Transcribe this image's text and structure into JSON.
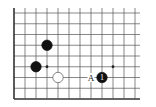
{
  "diagram": {
    "type": "go-board-fragment",
    "grid": {
      "cols": 12,
      "rows": 9,
      "origin_x": 14,
      "origin_y": 13,
      "spacing_x": 11,
      "spacing_y": 10.75,
      "line_color": "#555555",
      "edge_color": "#333333",
      "edges": [
        "left",
        "bottom"
      ]
    },
    "star_points": [
      {
        "col": 3,
        "row": 5
      },
      {
        "col": 9,
        "row": 5
      }
    ],
    "stones": [
      {
        "color": "black",
        "col": 3,
        "row": 3,
        "label": ""
      },
      {
        "color": "black",
        "col": 2,
        "row": 5,
        "label": ""
      },
      {
        "color": "white",
        "col": 4,
        "row": 6,
        "label": ""
      },
      {
        "color": "black",
        "col": 8,
        "row": 6,
        "label": "1"
      }
    ],
    "markers": [
      {
        "text": "A",
        "col": 7,
        "row": 6
      }
    ]
  }
}
